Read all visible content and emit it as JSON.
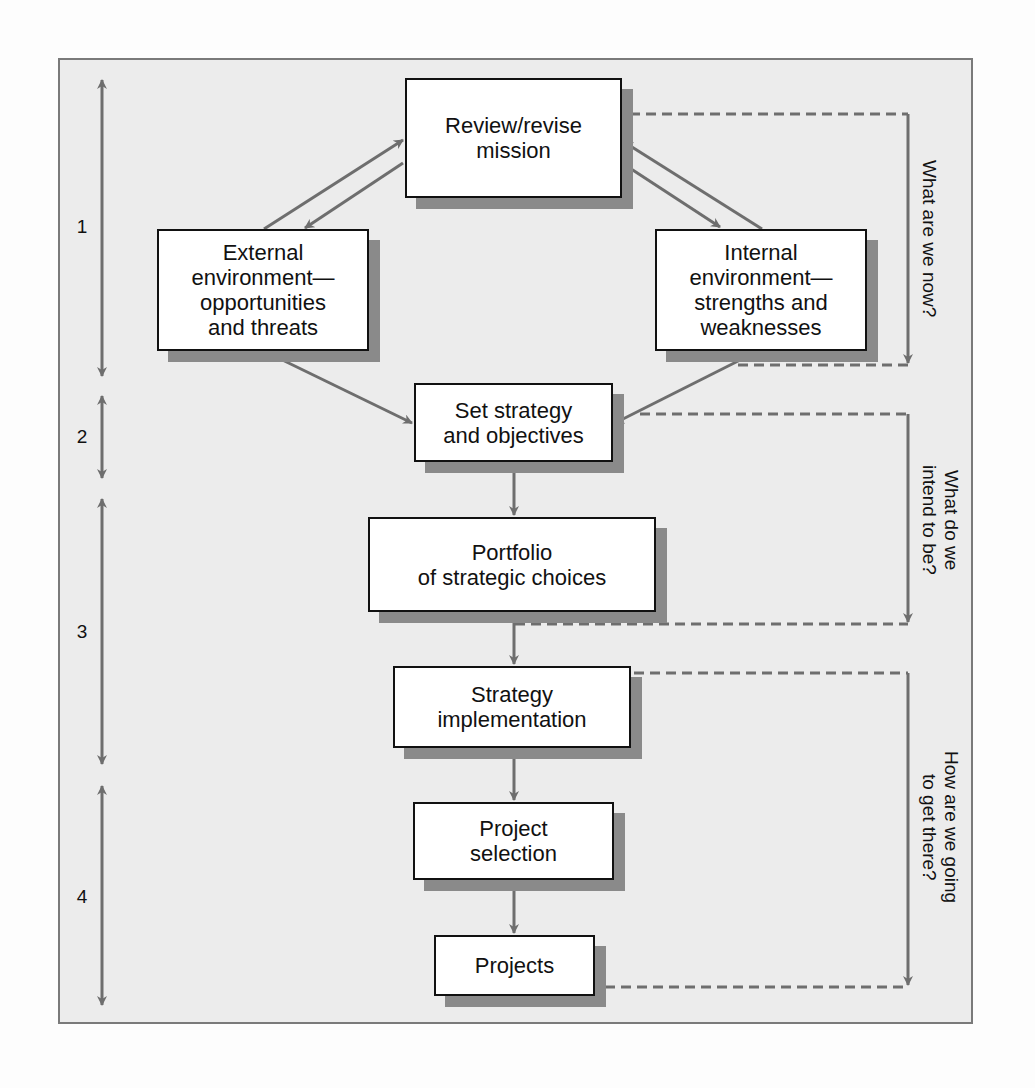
{
  "diagram": {
    "boxes": {
      "mission": "Review/revise\nmission",
      "external": "External\nenvironment—\nopportunities\nand threats",
      "internal": "Internal\nenvironment—\nstrengths and\nweaknesses",
      "strategy": "Set strategy\nand objectives",
      "portfolio": "Portfolio\nof strategic choices",
      "implementation": "Strategy\nimplementation",
      "selection": "Project\nselection",
      "projects": "Projects"
    },
    "phases": [
      {
        "label": "1"
      },
      {
        "label": "2"
      },
      {
        "label": "3"
      },
      {
        "label": "4"
      }
    ],
    "questions": [
      {
        "label": "What are we now?"
      },
      {
        "label": "What do we\nintend to be?"
      },
      {
        "label": "How are we going\nto get there?"
      }
    ],
    "colors": {
      "arrow": "#6e6e6e",
      "shadow": "#8a8a8a",
      "panel": "#ececec",
      "box_border": "#111111"
    }
  }
}
